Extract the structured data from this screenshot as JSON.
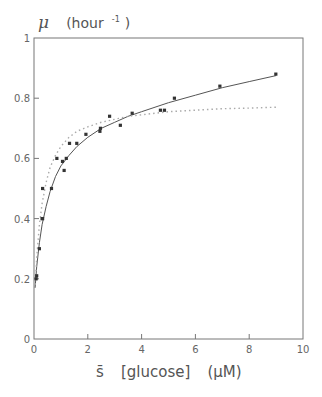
{
  "chart_data": {
    "type": "scatter",
    "title": "",
    "ylabel_symbol": "μ",
    "ylabel_unit_prefix": "(hour",
    "ylabel_unit_exp": "-1",
    "ylabel_unit_suffix": ")",
    "xlabel_symbol": "s̄",
    "xlabel_text": "[glucose]",
    "xlabel_unit": "(μM)",
    "xlim": [
      0,
      10
    ],
    "ylim": [
      0,
      1
    ],
    "xticks": [
      0,
      2,
      4,
      6,
      8,
      10
    ],
    "xtick_labels": [
      "0",
      "2",
      "4",
      "6",
      "8",
      "10"
    ],
    "yticks": [
      0,
      0.2,
      0.4,
      0.6,
      0.8,
      1
    ],
    "ytick_labels": [
      "0",
      "0.2",
      "0.4",
      "0.6",
      "0.8",
      "1"
    ],
    "grid": false,
    "series": [
      {
        "name": "measured",
        "kind": "points",
        "x": [
          0.08,
          0.1,
          0.2,
          0.3,
          0.32,
          0.32,
          0.65,
          0.85,
          1.06,
          1.12,
          1.2,
          1.32,
          1.59,
          1.93,
          2.45,
          2.47,
          2.81,
          3.21,
          3.65,
          4.7,
          4.85,
          5.22,
          6.91,
          8.99
        ],
        "y": [
          0.2,
          0.21,
          0.3,
          0.4,
          0.4,
          0.5,
          0.5,
          0.6,
          0.59,
          0.56,
          0.6,
          0.65,
          0.65,
          0.68,
          0.69,
          0.7,
          0.74,
          0.71,
          0.75,
          0.76,
          0.76,
          0.8,
          0.84,
          0.88
        ]
      },
      {
        "name": "fit-solid",
        "kind": "line",
        "style": "solid",
        "x": [
          0.04,
          0.1,
          0.2,
          0.3,
          0.45,
          0.6,
          0.8,
          1.0,
          1.3,
          1.6,
          2.0,
          2.5,
          3.0,
          3.5,
          4.0,
          5.0,
          6.0,
          7.0,
          8.0,
          9.0
        ],
        "y": [
          0.17,
          0.24,
          0.32,
          0.38,
          0.44,
          0.49,
          0.54,
          0.575,
          0.61,
          0.64,
          0.67,
          0.7,
          0.72,
          0.74,
          0.755,
          0.785,
          0.81,
          0.835,
          0.855,
          0.875
        ]
      },
      {
        "name": "fit-dotted",
        "kind": "line",
        "style": "dotted",
        "x": [
          0.05,
          0.1,
          0.2,
          0.3,
          0.45,
          0.6,
          0.8,
          1.0,
          1.3,
          1.6,
          2.0,
          2.5,
          3.0,
          3.5,
          4.0,
          5.0,
          6.0,
          7.0,
          8.0,
          9.0
        ],
        "y": [
          0.18,
          0.27,
          0.38,
          0.45,
          0.52,
          0.57,
          0.61,
          0.64,
          0.67,
          0.69,
          0.705,
          0.72,
          0.73,
          0.74,
          0.745,
          0.755,
          0.76,
          0.765,
          0.767,
          0.77
        ]
      }
    ],
    "colors": {
      "axis": "#777777",
      "points": "#333333",
      "solid_line": "#555555",
      "dotted_line": "#aaaaaa"
    }
  }
}
